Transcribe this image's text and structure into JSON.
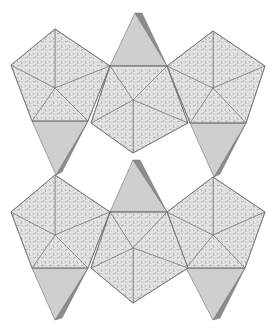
{
  "diagram": {
    "width": 272,
    "height": 328,
    "colors": {
      "background": "#ffffff",
      "octa_face": "#e2e2e2",
      "octa_pattern": "#8a8a8a",
      "tetra_face": "#cfcfcf",
      "tetra_side": "#8c8c8c",
      "edge": "#6e6e6e"
    },
    "octahedra": [
      {
        "id": "upper-left",
        "center": [
          55,
          88
        ],
        "rim": [
          [
            55,
            29
          ],
          [
            110,
            66
          ],
          [
            88,
            121
          ],
          [
            32,
            121
          ],
          [
            11,
            65
          ]
        ]
      },
      {
        "id": "upper-right",
        "center": [
          213,
          88
        ],
        "rim": [
          [
            213,
            31
          ],
          [
            265,
            66
          ],
          [
            246,
            123
          ],
          [
            190,
            123
          ],
          [
            167,
            66
          ]
        ]
      },
      {
        "id": "upper-center",
        "center": [
          133,
          100
        ],
        "rim": [
          [
            110,
            66
          ],
          [
            167,
            66
          ],
          [
            188,
            123
          ],
          [
            133,
            153
          ],
          [
            91,
            123
          ]
        ]
      },
      {
        "id": "lower-left",
        "center": [
          55,
          235
        ],
        "rim": [
          [
            55,
            175
          ],
          [
            110,
            212
          ],
          [
            88,
            268
          ],
          [
            32,
            268
          ],
          [
            11,
            212
          ]
        ]
      },
      {
        "id": "lower-right",
        "center": [
          213,
          235
        ],
        "rim": [
          [
            213,
            177
          ],
          [
            265,
            212
          ],
          [
            245,
            268
          ],
          [
            186,
            268
          ],
          [
            167,
            212
          ]
        ]
      },
      {
        "id": "lower-center",
        "center": [
          133,
          248
        ],
        "rim": [
          [
            110,
            212
          ],
          [
            167,
            212
          ],
          [
            188,
            268
          ],
          [
            133,
            303
          ],
          [
            91,
            268
          ]
        ]
      }
    ],
    "tetrahedra": [
      {
        "id": "top-center",
        "base": [
          [
            110,
            66
          ],
          [
            167,
            66
          ]
        ],
        "apex": [
          135,
          13
        ],
        "side_apex": [
          142,
          13
        ]
      },
      {
        "id": "upper-left",
        "base": [
          [
            32,
            121
          ],
          [
            88,
            121
          ]
        ],
        "apex": [
          56,
          175
        ],
        "side_apex": [
          62,
          172
        ]
      },
      {
        "id": "upper-right",
        "base": [
          [
            190,
            123
          ],
          [
            246,
            123
          ]
        ],
        "apex": [
          214,
          177
        ],
        "side_apex": [
          220,
          174
        ]
      },
      {
        "id": "middle-center",
        "base": [
          [
            110,
            212
          ],
          [
            167,
            212
          ]
        ],
        "apex": [
          133,
          160
        ],
        "side_apex": [
          140,
          160
        ]
      },
      {
        "id": "lower-left",
        "base": [
          [
            32,
            268
          ],
          [
            88,
            268
          ]
        ],
        "apex": [
          55,
          320
        ],
        "side_apex": [
          62,
          318
        ]
      },
      {
        "id": "lower-right",
        "base": [
          [
            186,
            268
          ],
          [
            245,
            268
          ]
        ],
        "apex": [
          213,
          320
        ],
        "side_apex": [
          220,
          318
        ]
      }
    ]
  }
}
